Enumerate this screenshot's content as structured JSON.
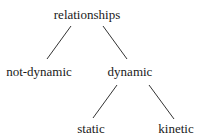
{
  "diagram": {
    "type": "tree",
    "nodes": [
      {
        "id": "root",
        "label": "relationships"
      },
      {
        "id": "not-dynamic",
        "label": "not-dynamic",
        "parent": "root"
      },
      {
        "id": "dynamic",
        "label": "dynamic",
        "parent": "root"
      },
      {
        "id": "static",
        "label": "static",
        "parent": "dynamic"
      },
      {
        "id": "kinetic",
        "label": "kinetic",
        "parent": "dynamic"
      }
    ],
    "edges": [
      [
        "relationships",
        "not-dynamic"
      ],
      [
        "relationships",
        "dynamic"
      ],
      [
        "dynamic",
        "static"
      ],
      [
        "dynamic",
        "kinetic"
      ]
    ]
  }
}
